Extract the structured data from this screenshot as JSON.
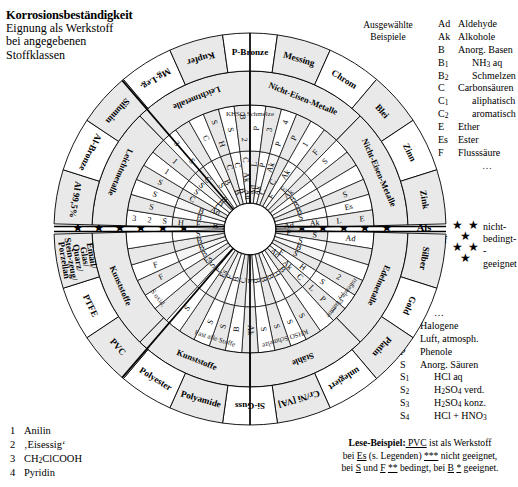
{
  "header": {
    "title": "Korrosionsbeständigkeit",
    "line2": "Eignung als Werkstoff",
    "line3": "bei angegebenen",
    "line4": "Stoffklassen"
  },
  "examples_note": {
    "line1": "Ausgewählte",
    "line2": "Beispiele"
  },
  "legend_top": [
    {
      "key": "Ad",
      "value": "Aldehyde",
      "indent": false
    },
    {
      "key": "Ak",
      "value": "Alkohole",
      "indent": false
    },
    {
      "key": "B",
      "value": "Anorg. Basen",
      "indent": false
    },
    {
      "key": "B1",
      "value": "NH3 aq",
      "indent": true
    },
    {
      "key": "B2",
      "value": "Schmelzen",
      "indent": true
    },
    {
      "key": "C",
      "value": "Carbonsäuren",
      "indent": false
    },
    {
      "key": "C1",
      "value": "aliphatisch",
      "indent": true
    },
    {
      "key": "C2",
      "value": "aromatisch",
      "indent": true
    },
    {
      "key": "E",
      "value": "Ether",
      "indent": false
    },
    {
      "key": "Es",
      "value": "Ester",
      "indent": false
    },
    {
      "key": "F",
      "value": "Flusssäure",
      "indent": false
    },
    {
      "key": "…",
      "value": "",
      "indent": true
    }
  ],
  "legend_bottom": [
    {
      "key": "",
      "value": "…",
      "indent": true
    },
    {
      "key": "H",
      "value": "Halogene",
      "indent": false
    },
    {
      "key": "L",
      "value": "Luft, atmosph.",
      "indent": false
    },
    {
      "key": "P",
      "value": "Phenole",
      "indent": false
    },
    {
      "key": "S",
      "value": "Anorg. Säuren",
      "indent": false
    },
    {
      "key": "S1",
      "value": "HCl aq",
      "indent": true
    },
    {
      "key": "S2",
      "value": "H2SO4 verd.",
      "indent": true
    },
    {
      "key": "S3",
      "value": "H2SO4 konz.",
      "indent": true
    },
    {
      "key": "S4",
      "value": "HCl + HNO3",
      "indent": true
    }
  ],
  "star_legend": {
    "label_line1": "Als",
    "label_line2": "Werkstoff",
    "stars": [
      "★ ★ ★",
      "★ ★",
      "★"
    ],
    "words": [
      "nicht-",
      "bedingt-",
      "-geeignet"
    ]
  },
  "axis_stars": {
    "left": "★ ★ ★   ★ ★   ★",
    "right": "★ ★   ★ ★ ★"
  },
  "reading_example": {
    "label": "Lese-Beispiel:",
    "t1": " PVC",
    "t2": " ist als Werkstoff",
    "t3": "bei ",
    "t4": "Es",
    "t5": " (s. Legenden) ",
    "t6": "***",
    "t7": " nicht geeignet,",
    "t8": "bei ",
    "t9": "S",
    "t10": " und ",
    "t11": "F",
    "t12": " ",
    "t13": "**",
    "t14": " bedingt, bei ",
    "t15": "B",
    "t16": " ",
    "t17": "*",
    "t18": " geeignet."
  },
  "notes": [
    {
      "n": "1",
      "text": "Anilin"
    },
    {
      "n": "2",
      "text": "‚Eisessig‘"
    },
    {
      "n": "3",
      "text": "CH2ClCOOH"
    },
    {
      "n": "4",
      "text": "Pyridin"
    }
  ],
  "chart_data": {
    "type": "pie",
    "title": "Korrosionsbeständigkeit",
    "outer_labels_top": [
      "Al 99,5%",
      "Al-Bronze",
      "Silumin",
      "Mg-Leg.",
      "Kupfer",
      "P-Bronze",
      "Messing",
      "Chrom",
      "Blei",
      "Zinn",
      "Zink"
    ],
    "inner_labels_top": [
      "Leichtmetalle",
      "Nicht-Eisen-Metalle"
    ],
    "outer_labels_bottom": [
      "Silber",
      "Gold",
      "Platin",
      "unlegiert",
      "Cr/Ni [VA]",
      "Si-Guss",
      "Polyamide",
      "Polyester",
      "PVC",
      "PTFE",
      "Email/Glas/Quarz/Stein-zeug/Porzellan"
    ],
    "inner_labels_bottom": [
      "Edelmetalle",
      "Stähle",
      "Kunststoffe"
    ],
    "sector_notes_top": [
      "KHSO Schmelze"
    ],
    "sector_notes_bottom": [
      "rußende Flamme",
      "KHSO Schmelze",
      "Fast alle Stoffe",
      "S oxid."
    ],
    "cells_top": [
      [
        "B",
        "F",
        "H",
        "S",
        "2",
        "3"
      ],
      [
        "B1",
        "S"
      ],
      [
        "B",
        "S"
      ],
      [
        "Ad",
        "C",
        "S"
      ],
      [
        "C2",
        "S",
        "1"
      ],
      [
        "B1",
        "S",
        "1"
      ],
      [
        "B1",
        "C1",
        "S",
        "3"
      ],
      [
        "S1"
      ],
      [
        "B",
        "C"
      ],
      [
        "B",
        "C",
        "H",
        "S"
      ],
      [
        "B",
        "C",
        "S"
      ],
      [
        "Ad",
        "Ak",
        "C",
        "2",
        "B"
      ],
      [
        "Ad",
        "L",
        "P"
      ],
      [
        "Ak",
        "P",
        "3"
      ],
      [
        "C",
        "Ak",
        "P",
        "4"
      ],
      [
        "C2",
        "P"
      ],
      [
        "F",
        "Ak",
        "1"
      ],
      [
        "E",
        "F"
      ],
      [
        "Ak",
        "S1"
      ],
      [
        "B"
      ],
      [
        "B"
      ],
      [
        "B",
        "S"
      ],
      [
        "S",
        "Es"
      ],
      [
        "Ad",
        "Ak",
        "L",
        "E"
      ]
    ],
    "cells_bottom": [
      [
        "F",
        "S",
        "Ad"
      ],
      [
        "S4"
      ],
      [
        "B2"
      ],
      [
        "S",
        "2"
      ],
      [
        "F",
        "H",
        "S1",
        "3"
      ],
      [
        "Ad",
        "Ak",
        "C",
        "L",
        "P",
        "1"
      ],
      [
        "B2"
      ],
      [
        "H",
        "S"
      ],
      [
        "B",
        "S"
      ],
      [
        "B",
        "S"
      ],
      [
        "B",
        "S"
      ],
      [
        "E",
        "Ak"
      ],
      [
        "C",
        "B"
      ],
      [
        "B",
        "S"
      ],
      [
        "F",
        "S"
      ],
      [
        "Es"
      ],
      [
        "F",
        "S1"
      ],
      [
        "S"
      ],
      [
        "Es"
      ],
      [
        "B",
        "F"
      ],
      [
        "B2",
        "F"
      ],
      [
        "B"
      ],
      [
        "S1"
      ]
    ]
  }
}
